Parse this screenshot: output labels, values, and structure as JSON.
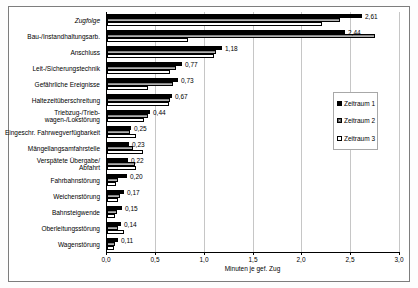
{
  "chart_data": {
    "type": "bar",
    "orientation": "horizontal",
    "title": "",
    "xlabel": "Minuten je gef. Zug",
    "xlim": [
      0,
      3.0
    ],
    "grid": true,
    "xticks": [
      {
        "value": 0.0,
        "label": "0,0"
      },
      {
        "value": 0.5,
        "label": "0,5"
      },
      {
        "value": 1.0,
        "label": "1,0"
      },
      {
        "value": 1.5,
        "label": "1,5"
      },
      {
        "value": 2.0,
        "label": "2,0"
      },
      {
        "value": 2.5,
        "label": "2,5"
      },
      {
        "value": 3.0,
        "label": "3,0"
      }
    ],
    "categories": [
      {
        "lines": [
          "Zugfolge"
        ],
        "italic": true
      },
      {
        "lines": [
          "Bau-/Instandhaltungsarb."
        ],
        "italic": false
      },
      {
        "lines": [
          "Anschluss"
        ],
        "italic": false
      },
      {
        "lines": [
          "Leit-/Sicherungstechnik"
        ],
        "italic": false
      },
      {
        "lines": [
          "Gefährliche Ereignisse"
        ],
        "italic": false
      },
      {
        "lines": [
          "Haltezeitüberschreitung"
        ],
        "italic": false
      },
      {
        "lines": [
          "Triebzug-/Trieb-",
          "wagen-/Lokstörung"
        ],
        "italic": false
      },
      {
        "lines": [
          "Eingeschr. Fahrwegverfügbarkeit"
        ],
        "italic": false
      },
      {
        "lines": [
          "Mängellangsamfahrstelle"
        ],
        "italic": false
      },
      {
        "lines": [
          "Verspätete Übergabe/",
          "Abfahrt"
        ],
        "italic": false
      },
      {
        "lines": [
          "Fahrbahnstörung"
        ],
        "italic": false
      },
      {
        "lines": [
          "Weichenstörung"
        ],
        "italic": false
      },
      {
        "lines": [
          "Bahnsteigwende"
        ],
        "italic": false
      },
      {
        "lines": [
          "Oberleitungsstörung"
        ],
        "italic": false
      },
      {
        "lines": [
          "Wagenstörung"
        ],
        "italic": false
      }
    ],
    "series": [
      {
        "name": "Zeitraum 1",
        "style": "black",
        "values": [
          2.61,
          2.44,
          1.18,
          0.77,
          0.73,
          0.67,
          0.44,
          0.25,
          0.23,
          0.22,
          0.2,
          0.17,
          0.15,
          0.14,
          0.11
        ],
        "labels": [
          "2,61",
          "2,44",
          "1,18",
          "0,77",
          "0,73",
          "0,67",
          "0,44",
          "0,25",
          "0,23",
          "0,22",
          "0,20",
          "0,17",
          "0,15",
          "0,14",
          "0,11"
        ]
      },
      {
        "name": "Zeitraum 2",
        "style": "gray-hatched",
        "values": [
          2.39,
          2.74,
          1.12,
          0.71,
          0.68,
          0.65,
          0.42,
          0.24,
          0.27,
          0.29,
          0.11,
          0.13,
          0.1,
          0.11,
          0.08
        ]
      },
      {
        "name": "Zeitraum 3",
        "style": "white-outline",
        "values": [
          2.2,
          0.83,
          1.1,
          0.64,
          0.42,
          0.63,
          0.38,
          0.3,
          0.37,
          0.3,
          0.09,
          0.11,
          0.08,
          0.17,
          0.07
        ]
      }
    ],
    "legend": {
      "position": "right-inside",
      "entries": [
        "Zeitraum 1",
        "Zeitraum 2",
        "Zeitraum 3"
      ]
    },
    "colors": {
      "series1": "#000000",
      "series2": "#9a9a9a",
      "series3": "#ffffff",
      "grid": "#c6c6c6",
      "axis": "#000000",
      "frame": "#7d7d7d"
    }
  }
}
